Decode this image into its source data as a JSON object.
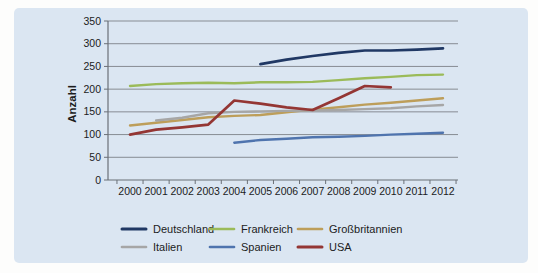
{
  "panel": {
    "background": "#dbe6f2"
  },
  "chart_data": {
    "type": "line",
    "title": "",
    "xlabel": "",
    "ylabel": "Anzahl",
    "ylim": [
      0,
      350
    ],
    "yticks": [
      0,
      50,
      100,
      150,
      200,
      250,
      300,
      350
    ],
    "grid": true,
    "legend_position": "bottom",
    "axis_color": "#6b7077",
    "grid_color": "#878c93",
    "categories": [
      "2000",
      "2001",
      "2002",
      "2003",
      "2004",
      "2005",
      "2006",
      "2007",
      "2008",
      "2009",
      "2010",
      "2011",
      "2012"
    ],
    "series": [
      {
        "name": "Deutschland",
        "color": "#203864",
        "width": 2.7,
        "values": [
          null,
          null,
          null,
          null,
          null,
          255,
          265,
          273,
          280,
          285,
          285,
          287,
          290
        ]
      },
      {
        "name": "Frankreich",
        "color": "#9bbb59",
        "width": 2.4,
        "values": [
          207,
          211,
          213,
          214,
          213,
          215,
          215,
          216,
          220,
          224,
          227,
          231,
          232
        ]
      },
      {
        "name": "Großbritannien",
        "color": "#bd9e5a",
        "width": 2.4,
        "values": [
          120,
          126,
          132,
          138,
          141,
          143,
          149,
          155,
          160,
          166,
          170,
          175,
          180
        ]
      },
      {
        "name": "Italien",
        "color": "#a6a6a6",
        "width": 2.4,
        "values": [
          null,
          131,
          137,
          147,
          150,
          151,
          152,
          153,
          154,
          156,
          158,
          162,
          165
        ]
      },
      {
        "name": "Spanien",
        "color": "#4f74ae",
        "width": 2.4,
        "values": [
          null,
          null,
          null,
          null,
          82,
          88,
          91,
          94,
          95,
          97,
          100,
          102,
          104
        ]
      },
      {
        "name": "USA",
        "color": "#943634",
        "width": 2.7,
        "values": [
          100,
          111,
          116,
          122,
          175,
          168,
          160,
          154,
          180,
          207,
          204,
          null,
          null
        ]
      }
    ]
  }
}
